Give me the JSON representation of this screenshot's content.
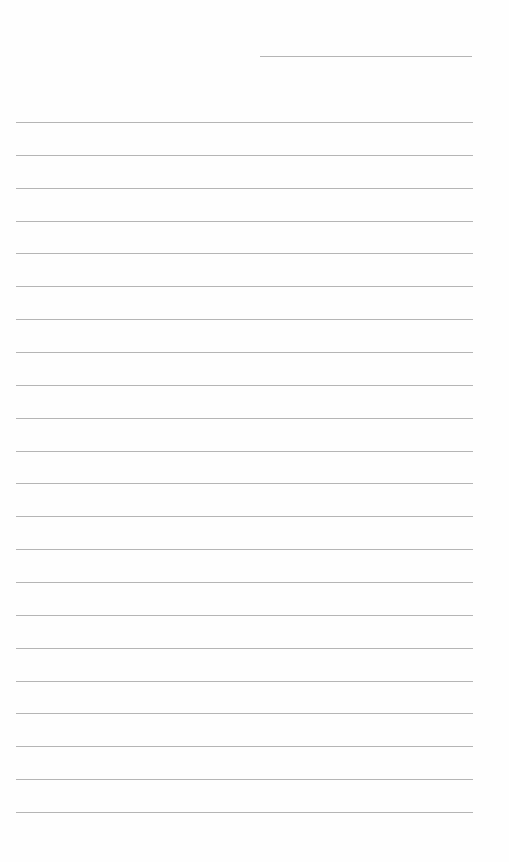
{
  "document": {
    "type": "lined-paper",
    "background": "#fefefe",
    "line_color": "#b5b5b5",
    "header_line": {
      "x": 260,
      "y": 56,
      "width": 212
    },
    "ruled_lines": {
      "count": 22,
      "start_y": 122,
      "spacing": 32.86,
      "x": 16,
      "width": 457
    }
  }
}
